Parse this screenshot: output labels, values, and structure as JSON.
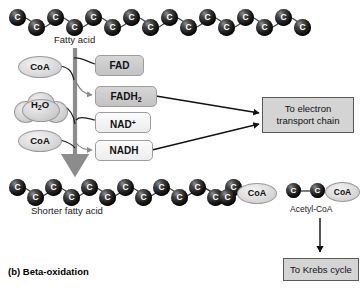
{
  "figure": {
    "caption": "(b) Beta-oxidation"
  },
  "chains": {
    "fatty_acid": {
      "label": "Fatty acid",
      "carbon_symbol": "C",
      "carbon_count": 16
    },
    "shorter_fatty_acid": {
      "label": "Shorter fatty acid",
      "carbon_symbol": "C",
      "carbon_count": 14,
      "terminal_label": "CoA"
    },
    "acetyl_coa": {
      "label": "Acetyl-CoA",
      "carbon_symbol": "C",
      "carbon_count": 2,
      "terminal_label": "CoA"
    }
  },
  "reactants": [
    {
      "name": "coa-top",
      "label": "CoA"
    },
    {
      "name": "water",
      "label": "H",
      "sub": "2",
      "label_tail": "O"
    },
    {
      "name": "coa-bottom",
      "label": "CoA"
    }
  ],
  "carriers": {
    "fad": {
      "label": "FAD"
    },
    "fadh2": {
      "label": "FADH",
      "sub": "2"
    },
    "nad_plus": {
      "label": "NAD",
      "sup": "+"
    },
    "nadh": {
      "label": "NADH"
    }
  },
  "destinations": {
    "electron_transport_chain": {
      "line1": "To electron",
      "line2": "transport chain"
    },
    "krebs_cycle": {
      "label": "To Krebs cycle"
    }
  },
  "colors": {
    "carbon_bead": "#1c1c1c",
    "carrier_grey": "#c9c9c9",
    "carrier_light": "#f2f2f2",
    "destination_box": "#d4d4d4",
    "main_arrow": "#8c8c8c",
    "connector_line": "#111111",
    "text": "#111111"
  }
}
